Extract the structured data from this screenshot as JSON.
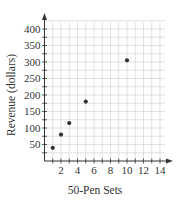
{
  "chart_data": {
    "type": "scatter",
    "title": "",
    "xlabel": "50-Pen Sets",
    "ylabel": "Revenue (dollars)",
    "xlim": [
      0,
      15
    ],
    "ylim": [
      0,
      425
    ],
    "x_ticks": [
      2,
      4,
      6,
      8,
      10,
      12,
      14
    ],
    "y_ticks": [
      50,
      100,
      150,
      200,
      250,
      300,
      350,
      400
    ],
    "grid": true,
    "legend": null,
    "points": [
      {
        "x": 1,
        "y": 40
      },
      {
        "x": 2,
        "y": 80
      },
      {
        "x": 3,
        "y": 115
      },
      {
        "x": 5,
        "y": 180
      },
      {
        "x": 10,
        "y": 305
      }
    ],
    "colors": {
      "point": "#333333",
      "grid": "#cfcfcf",
      "axis": "#333333"
    }
  }
}
